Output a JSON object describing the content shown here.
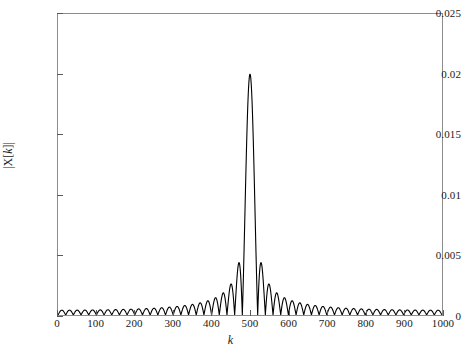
{
  "chart_data": {
    "type": "line",
    "title": "",
    "subtitle": "",
    "xlabel": "k",
    "ylabel": "|X[k]|",
    "ylabel_parts": {
      "pre": "|X[",
      "var": "k",
      "post": "]|"
    },
    "xlim": [
      0,
      1000
    ],
    "ylim": [
      0,
      0.025
    ],
    "xticks": [
      0,
      100,
      200,
      300,
      400,
      500,
      600,
      700,
      800,
      900,
      1000
    ],
    "xtick_labels": [
      "0",
      "100",
      "200",
      "300",
      "400",
      "500",
      "600",
      "700",
      "800",
      "900",
      "1000"
    ],
    "yticks": [
      0,
      0.005,
      0.01,
      0.015,
      0.02,
      0.025
    ],
    "ytick_labels": [
      "0",
      "0.005",
      "0.01",
      "0.015",
      "0.02",
      "0.025"
    ],
    "grid": false,
    "legend": null,
    "line_color": "#000000",
    "line_width": 1.1,
    "frame_color": "#8d8d8d",
    "background": "#ffffff",
    "series": [
      {
        "name": "|X[k]|",
        "model": "dirichlet",
        "center": 500,
        "peak": 0.02,
        "num_points": 1001,
        "main_lobe_half_width": 20,
        "sidelobe_period": 20,
        "N": 50,
        "M": 1000,
        "annotated_points": [
          {
            "k": 0,
            "value": 0.0009
          },
          {
            "k": 100,
            "value": 0.0008
          },
          {
            "k": 200,
            "value": 0.0009
          },
          {
            "k": 300,
            "value": 0.0011
          },
          {
            "k": 400,
            "value": 0.0016
          },
          {
            "k": 430,
            "value": 0.0024
          },
          {
            "k": 460,
            "value": 0.0046
          },
          {
            "k": 480,
            "value": 0.0
          },
          {
            "k": 500,
            "value": 0.02
          },
          {
            "k": 520,
            "value": 0.0
          },
          {
            "k": 540,
            "value": 0.0046
          },
          {
            "k": 570,
            "value": 0.0024
          },
          {
            "k": 600,
            "value": 0.0016
          },
          {
            "k": 700,
            "value": 0.0011
          },
          {
            "k": 800,
            "value": 0.0009
          },
          {
            "k": 900,
            "value": 0.0008
          },
          {
            "k": 1000,
            "value": 0.0009
          }
        ]
      }
    ]
  }
}
